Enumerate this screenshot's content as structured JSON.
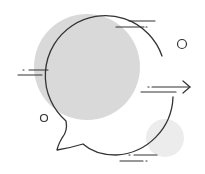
{
  "illustration": {
    "subject": "speech-bubble-with-arrow",
    "colors": {
      "background": "#ffffff",
      "blob_large": "#d9d9d9",
      "blob_small": "#ececec",
      "stroke": "#333333"
    }
  }
}
